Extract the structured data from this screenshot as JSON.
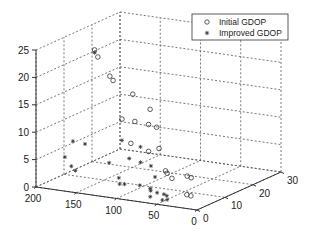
{
  "chart_data": {
    "type": "scatter",
    "dimensions": 3,
    "title": "",
    "xlabel": "",
    "ylabel": "",
    "zlabel": "",
    "xlim": [
      0,
      200
    ],
    "ylim": [
      0,
      30
    ],
    "zlim": [
      0,
      25
    ],
    "x_ticks": [
      "0",
      "50",
      "100",
      "150",
      "200"
    ],
    "y_ticks": [
      "0",
      "10",
      "20",
      "30"
    ],
    "z_ticks": [
      "0",
      "5",
      "10",
      "15",
      "20",
      "25"
    ],
    "grid": true,
    "legend_position": "top-right",
    "series": [
      {
        "name": "Initial GDOP",
        "marker": "circle",
        "points": [
          [
            162,
            10,
            23.5
          ],
          [
            158,
            10,
            22.3
          ],
          [
            150,
            12,
            18.5
          ],
          [
            146,
            12,
            17.8
          ],
          [
            125,
            13,
            15.5
          ],
          [
            128,
            10,
            11.6
          ],
          [
            100,
            12,
            13.5
          ],
          [
            112,
            10,
            11.5
          ],
          [
            95,
            10,
            11.3
          ],
          [
            85,
            10,
            11.0
          ],
          [
            110,
            8,
            8.0
          ],
          [
            88,
            8,
            7.0
          ],
          [
            75,
            8,
            7.8
          ],
          [
            60,
            6,
            4.5
          ],
          [
            58,
            6,
            4.1
          ],
          [
            52,
            6,
            3.3
          ],
          [
            40,
            8,
            3.5
          ],
          [
            35,
            8,
            3.3
          ],
          [
            30,
            5,
            1.0
          ],
          [
            25,
            5,
            0.9
          ]
        ]
      },
      {
        "name": "Improved GDOP",
        "marker": "star",
        "points": [
          [
            162,
            10,
            23.0
          ],
          [
            175,
            6,
            7.5
          ],
          [
            178,
            4,
            5.0
          ],
          [
            170,
            4,
            3.5
          ],
          [
            165,
            4,
            2.8
          ],
          [
            160,
            6,
            7.3
          ],
          [
            130,
            6,
            4.5
          ],
          [
            128,
            10,
            7.7
          ],
          [
            112,
            8,
            5.2
          ],
          [
            105,
            10,
            7.0
          ],
          [
            98,
            8,
            4.8
          ],
          [
            92,
            10,
            3.8
          ],
          [
            80,
            8,
            2.5
          ],
          [
            85,
            4,
            1.8
          ],
          [
            110,
            4,
            1.5
          ],
          [
            104,
            4,
            1.6
          ],
          [
            118,
            6,
            2.0
          ],
          [
            72,
            4,
            1.5
          ],
          [
            68,
            3,
            1.4
          ],
          [
            60,
            3,
            1.2
          ],
          [
            55,
            4,
            0.8
          ],
          [
            48,
            3,
            0.9
          ],
          [
            65,
            2,
            0.6
          ],
          [
            50,
            2,
            0.3
          ],
          [
            44,
            2,
            0.5
          ]
        ]
      }
    ]
  },
  "legend": {
    "items": [
      {
        "label": "Initial GDOP",
        "icon": "circle-marker-icon"
      },
      {
        "label": "Improved GDOP",
        "icon": "star-marker-icon"
      }
    ]
  },
  "colors": {
    "marker": "#333333",
    "grid": "#555555",
    "background": "#ffffff"
  }
}
